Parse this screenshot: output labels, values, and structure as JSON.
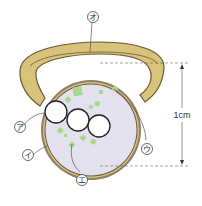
{
  "diagram": {
    "labels": [
      {
        "id": "a",
        "text": "ア",
        "points_to": "left white bubble"
      },
      {
        "id": "i",
        "text": "イ",
        "points_to": "bezel rim"
      },
      {
        "id": "u",
        "text": "ウ",
        "points_to": "green particle top-right"
      },
      {
        "id": "e",
        "text": "エ",
        "points_to": "green particle bottom-left"
      },
      {
        "id": "o",
        "text": "オ",
        "points_to": "ring band"
      }
    ],
    "dimension": {
      "text": "1cm",
      "spans": "bezel diameter (vertical)"
    },
    "colors": {
      "band": "#d9c27a",
      "band_outline": "#6b5a3a",
      "bezel_fill": "#e4e1ee",
      "bezel_rim": "#8a7f6a",
      "particle": "#a9d88a",
      "bubble": "#ffffff",
      "line": "#555555"
    }
  }
}
